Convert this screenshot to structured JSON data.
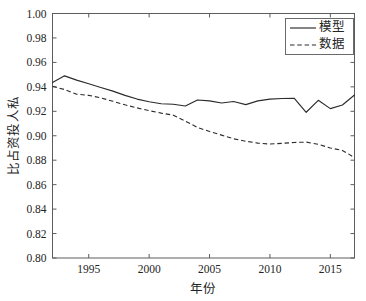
{
  "chart_data": {
    "type": "line",
    "title": "",
    "xlabel": "年份",
    "ylabel": "私人投资占比",
    "xlim": [
      1992,
      2017
    ],
    "ylim": [
      0.8,
      1.0
    ],
    "grid": false,
    "legend_position": "top-right",
    "x": [
      1992,
      1993,
      1994,
      1995,
      1996,
      1997,
      1998,
      1999,
      2000,
      2001,
      2002,
      2003,
      2004,
      2005,
      2006,
      2007,
      2008,
      2009,
      2010,
      2011,
      2012,
      2013,
      2014,
      2015,
      2016,
      2017
    ],
    "xticks": [
      1995,
      2000,
      2005,
      2010,
      2015
    ],
    "xtick_labels": [
      "1995",
      "2000",
      "2005",
      "2010",
      "2015"
    ],
    "yticks": [
      0.8,
      0.82,
      0.84,
      0.86,
      0.88,
      0.9,
      0.92,
      0.94,
      0.96,
      0.98,
      1.0
    ],
    "ytick_labels": [
      "0.80",
      "0.82",
      "0.84",
      "0.86",
      "0.88",
      "0.90",
      "0.92",
      "0.94",
      "0.96",
      "0.98",
      "1.00"
    ],
    "series": [
      {
        "name": "模型",
        "style": "solid",
        "color": "#2b2b2b",
        "values": [
          0.9435,
          0.949,
          0.9455,
          0.9425,
          0.9395,
          0.9365,
          0.933,
          0.93,
          0.9278,
          0.9262,
          0.9258,
          0.9243,
          0.9292,
          0.9285,
          0.9268,
          0.928,
          0.9255,
          0.9285,
          0.93,
          0.9305,
          0.9307,
          0.9192,
          0.929,
          0.9222,
          0.9252,
          0.9333
        ]
      },
      {
        "name": "数据",
        "style": "dashed",
        "color": "#2b2b2b",
        "values": [
          0.9405,
          0.9378,
          0.934,
          0.933,
          0.931,
          0.9282,
          0.9253,
          0.9228,
          0.9205,
          0.9185,
          0.9168,
          0.912,
          0.9068,
          0.9035,
          0.9005,
          0.8975,
          0.8955,
          0.894,
          0.8932,
          0.8938,
          0.8945,
          0.8948,
          0.893,
          0.89,
          0.888,
          0.8822
        ]
      }
    ]
  },
  "legend": {
    "entries": [
      {
        "label": "模型",
        "style": "solid"
      },
      {
        "label": "数据",
        "style": "dashed"
      }
    ]
  },
  "axes": {
    "y_axis_title": "私人投资占比",
    "x_axis_title": "年份"
  }
}
